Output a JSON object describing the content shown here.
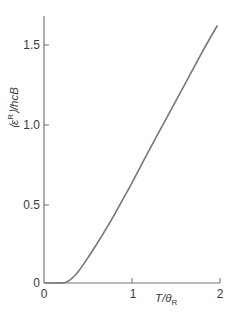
{
  "chart_data": {
    "type": "line",
    "title": "",
    "xlabel": "T/θR",
    "xlabel_main": "T/θ",
    "xlabel_sub": "R",
    "ylabel": "⟨ε^R⟩/hcB",
    "ylabel_parts": {
      "open": "⟨ε",
      "sup": "R",
      "close": "⟩/hcB"
    },
    "xlim": [
      0,
      2
    ],
    "ylim": [
      0,
      1.7
    ],
    "grid": false,
    "legend": "none",
    "x_ticks": [
      0,
      1,
      2
    ],
    "x_tick_labels": [
      "0",
      "1",
      "2"
    ],
    "y_ticks": [
      0,
      0.5,
      1.0,
      1.5
    ],
    "y_tick_labels": [
      "0",
      "0.5",
      "1.0",
      "1.5"
    ],
    "series": [
      {
        "name": "rotational mean energy",
        "color": "#777777",
        "x": [
          0,
          0.1,
          0.2,
          0.25,
          0.3,
          0.35,
          0.4,
          0.45,
          0.5,
          0.6,
          0.7,
          0.8,
          0.9,
          1.0,
          1.2,
          1.4,
          1.6,
          1.8,
          1.97
        ],
        "y": [
          0,
          0.0,
          0.0004,
          0.005,
          0.021,
          0.047,
          0.08,
          0.119,
          0.16,
          0.245,
          0.335,
          0.43,
          0.53,
          0.63,
          0.84,
          1.045,
          1.25,
          1.455,
          1.62
        ]
      }
    ]
  }
}
